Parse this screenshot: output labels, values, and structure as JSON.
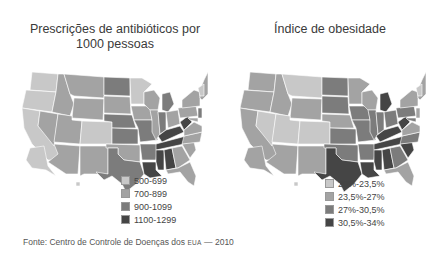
{
  "left_map": {
    "title_line1": "Prescrições de antibióticos por",
    "title_line2": "1000 pessoas",
    "legend": [
      {
        "label": "500-699",
        "color": "#c8c8c8"
      },
      {
        "label": "700-899",
        "color": "#a3a3a3"
      },
      {
        "label": "900-1099",
        "color": "#7c7c7c"
      },
      {
        "label": "1100-1299",
        "color": "#454545"
      }
    ]
  },
  "right_map": {
    "title": "Índice de obesidade",
    "legend": [
      {
        "label": "20%-23,5%",
        "color": "#c8c8c8"
      },
      {
        "label": "23,5%-27%",
        "color": "#a3a3a3"
      },
      {
        "label": "27%-30,5%",
        "color": "#7c7c7c"
      },
      {
        "label": "30,5%-34%",
        "color": "#454545"
      }
    ]
  },
  "source": {
    "prefix": "Fonte: Centro de Controle de Doenças dos ",
    "abbr": "EUA",
    "suffix": " — 2010"
  }
}
